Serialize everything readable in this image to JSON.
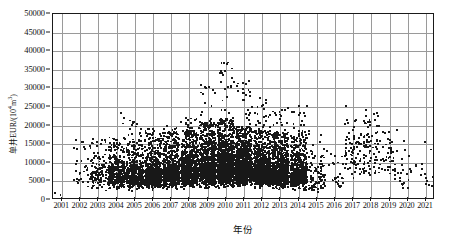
{
  "chart_data": {
    "type": "scatter",
    "title": "",
    "xlabel": "年份",
    "ylabel": "单井EUR/(10⁴m³)",
    "ylabel_plain": "单井EUR/(10",
    "ylabel_sup": "4",
    "ylabel_tail": "m³)",
    "xlim": [
      2000.5,
      2021.5
    ],
    "ylim": [
      0,
      50000
    ],
    "grid": true,
    "legend": null,
    "point_color": "#181818",
    "grid_color": "#9a9a9a",
    "axis_color": "#1a1a1a",
    "ytick_labels": [
      "50000",
      "45000",
      "40000",
      "35000",
      "30000",
      "25000",
      "20000",
      "15000",
      "10000",
      "5000",
      "0"
    ],
    "ytick_values": [
      50000,
      45000,
      40000,
      35000,
      30000,
      25000,
      20000,
      15000,
      10000,
      5000,
      0
    ],
    "xtick_labels": [
      "2001",
      "2002",
      "2003",
      "2004",
      "2005",
      "2006",
      "2007",
      "2008",
      "2009",
      "2010",
      "2011",
      "2012",
      "2013",
      "2014",
      "2015",
      "2016",
      "2017",
      "2018",
      "2019",
      "2020",
      "2021"
    ],
    "xtick_values": [
      2001,
      2002,
      2003,
      2004,
      2005,
      2006,
      2007,
      2008,
      2009,
      2010,
      2011,
      2012,
      2013,
      2014,
      2015,
      2016,
      2017,
      2018,
      2019,
      2020,
      2021
    ],
    "series": [
      {
        "name": "单井EUR",
        "yearly_summary": [
          {
            "year": 2001,
            "count": 2,
            "median": 1500,
            "p90": 1800,
            "max": 1800
          },
          {
            "year": 2002,
            "count": 30,
            "median": 7000,
            "p90": 13500,
            "max": 15500
          },
          {
            "year": 2003,
            "count": 120,
            "median": 6500,
            "p90": 13000,
            "max": 17500
          },
          {
            "year": 2004,
            "count": 320,
            "median": 6500,
            "p90": 13500,
            "max": 24000
          },
          {
            "year": 2005,
            "count": 420,
            "median": 6200,
            "p90": 13000,
            "max": 21500
          },
          {
            "year": 2006,
            "count": 520,
            "median": 6500,
            "p90": 14000,
            "max": 19500
          },
          {
            "year": 2007,
            "count": 620,
            "median": 7000,
            "p90": 14500,
            "max": 20500
          },
          {
            "year": 2008,
            "count": 760,
            "median": 7500,
            "p90": 15000,
            "max": 22000
          },
          {
            "year": 2009,
            "count": 860,
            "median": 8000,
            "p90": 16500,
            "max": 31000
          },
          {
            "year": 2010,
            "count": 960,
            "median": 8500,
            "p90": 17500,
            "max": 37500
          },
          {
            "year": 2011,
            "count": 900,
            "median": 8000,
            "p90": 16000,
            "max": 33000
          },
          {
            "year": 2012,
            "count": 820,
            "median": 7500,
            "p90": 15000,
            "max": 27500
          },
          {
            "year": 2013,
            "count": 760,
            "median": 7000,
            "p90": 14500,
            "max": 26500
          },
          {
            "year": 2014,
            "count": 520,
            "median": 6500,
            "p90": 14000,
            "max": 26000
          },
          {
            "year": 2015,
            "count": 90,
            "median": 5000,
            "p90": 11000,
            "max": 19500
          },
          {
            "year": 2016,
            "count": 26,
            "median": 6000,
            "p90": 13000,
            "max": 18000
          },
          {
            "year": 2017,
            "count": 70,
            "median": 12000,
            "p90": 19000,
            "max": 23500
          },
          {
            "year": 2018,
            "count": 80,
            "median": 11500,
            "p90": 19500,
            "max": 24500
          },
          {
            "year": 2019,
            "count": 45,
            "median": 10500,
            "p90": 18000,
            "max": 21500
          },
          {
            "year": 2020,
            "count": 22,
            "median": 7000,
            "p90": 14000,
            "max": 17500
          },
          {
            "year": 2021,
            "count": 14,
            "median": 6000,
            "p90": 13500,
            "max": 18500
          }
        ],
        "notes": "Dense black point cloud 2003-2014 concentrated below 15000; high outliers peak near 37500 around 2010; sparse scatter 2015-2021 with a secondary cluster 2017-2019 centred near 11000-13000."
      }
    ]
  }
}
